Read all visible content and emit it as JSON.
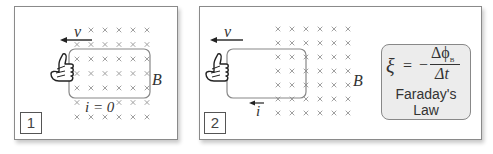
{
  "panels": [
    {
      "number": "1",
      "velocity_label": "v",
      "field_label": "B",
      "current_label": "i = 0",
      "loop_state": "fully inside field"
    },
    {
      "number": "2",
      "velocity_label": "v",
      "field_label": "B",
      "current_label": "i",
      "loop_state": "partially leaving field"
    }
  ],
  "formula": {
    "lhs": "ξ",
    "equals": "=",
    "sign": "−",
    "numerator": "Δϕ",
    "numerator_subscript": "B",
    "denominator": "Δt",
    "title_line1": "Faraday's",
    "title_line2": "Law"
  },
  "colors": {
    "field_x": "#9a9a9a",
    "loop": "#888888",
    "formula_bg": "#ececec",
    "text": "#333333"
  },
  "icons": {
    "hand": "thumbs-up-hand-icon",
    "field_marker": "x-into-page-icon",
    "arrow": "left-arrow-icon"
  }
}
